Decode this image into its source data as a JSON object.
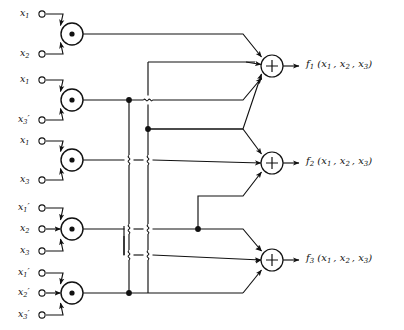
{
  "diagram": {
    "type": "logic-circuit",
    "background": "#ffffff",
    "line_color": "#1a1a1a",
    "gate_fill": "#ffffff"
  },
  "and_gates": [
    {
      "id": "and1",
      "symbol": "·",
      "cx": 72,
      "cy": 34,
      "r": 11,
      "inputs": [
        "x1",
        "x2"
      ],
      "product": "x1 x2"
    },
    {
      "id": "and2",
      "symbol": "·",
      "cx": 72,
      "cy": 100,
      "r": 11,
      "inputs": [
        "x1",
        "x3'"
      ],
      "product": "x1 x3'"
    },
    {
      "id": "and3",
      "symbol": "·",
      "cx": 72,
      "cy": 160,
      "r": 11,
      "inputs": [
        "x1",
        "x3"
      ],
      "product": "x1 x3"
    },
    {
      "id": "and4",
      "symbol": "·",
      "cx": 72,
      "cy": 229,
      "r": 11,
      "inputs": [
        "x1'",
        "x2",
        "x3"
      ],
      "product": "x1' x2 x3"
    },
    {
      "id": "and5",
      "symbol": "·",
      "cx": 72,
      "cy": 293,
      "r": 11,
      "inputs": [
        "x1'",
        "x2'",
        "x3'"
      ],
      "product": "x1' x2' x3'"
    }
  ],
  "adders": [
    {
      "id": "sum1",
      "symbol": "+",
      "cx": 272,
      "cy": 66,
      "r": 11,
      "output": "f1"
    },
    {
      "id": "sum2",
      "symbol": "+",
      "cx": 272,
      "cy": 163,
      "r": 11,
      "output": "f2"
    },
    {
      "id": "sum3",
      "symbol": "+",
      "cx": 272,
      "cy": 260,
      "r": 11,
      "output": "f3"
    }
  ],
  "input_terminals": [
    {
      "id": "t1",
      "base": "x",
      "sub": "1",
      "prime": false,
      "x": 38,
      "y": 14,
      "label": "x1"
    },
    {
      "id": "t2",
      "base": "x",
      "sub": "2",
      "prime": false,
      "x": 38,
      "y": 54,
      "label": "x2"
    },
    {
      "id": "t3",
      "base": "x",
      "sub": "1",
      "prime": false,
      "x": 38,
      "y": 80,
      "label": "x1"
    },
    {
      "id": "t4",
      "base": "x",
      "sub": "3",
      "prime": true,
      "x": 38,
      "y": 120,
      "label": "x3'"
    },
    {
      "id": "t5",
      "base": "x",
      "sub": "1",
      "prime": false,
      "x": 38,
      "y": 141,
      "label": "x1"
    },
    {
      "id": "t6",
      "base": "x",
      "sub": "3",
      "prime": false,
      "x": 38,
      "y": 180,
      "label": "x3"
    },
    {
      "id": "t7",
      "base": "x",
      "sub": "1",
      "prime": true,
      "x": 38,
      "y": 208,
      "label": "x1'"
    },
    {
      "id": "t8",
      "base": "x",
      "sub": "2",
      "prime": false,
      "x": 38,
      "y": 229,
      "label": "x2"
    },
    {
      "id": "t9",
      "base": "x",
      "sub": "3",
      "prime": false,
      "x": 38,
      "y": 251,
      "label": "x3"
    },
    {
      "id": "t10",
      "base": "x",
      "sub": "1",
      "prime": true,
      "x": 38,
      "y": 273,
      "label": "x1'"
    },
    {
      "id": "t11",
      "base": "x",
      "sub": "2",
      "prime": true,
      "x": 38,
      "y": 293,
      "label": "x2'"
    },
    {
      "id": "t12",
      "base": "x",
      "sub": "3",
      "prime": true,
      "x": 38,
      "y": 315,
      "label": "x3'"
    }
  ],
  "outputs": [
    {
      "id": "f1",
      "fn": "f",
      "sub": "1",
      "args": "(x1 , x2 , x3)",
      "x": 300,
      "y": 66,
      "text": "f1 (x1 , x2 , x3)"
    },
    {
      "id": "f2",
      "fn": "f",
      "sub": "2",
      "args": "(x1 , x2 , x3)",
      "x": 300,
      "y": 163,
      "text": "f2 (x1 , x2 , x3)"
    },
    {
      "id": "f3",
      "fn": "f",
      "sub": "3",
      "args": "(x1 , x2 , x3)",
      "x": 300,
      "y": 260,
      "text": "f3 (x1 , x2 , x3)"
    }
  ],
  "bus_lines": [
    {
      "id": "bus-a",
      "x": 129,
      "from_y": 100,
      "to_y": 293
    },
    {
      "id": "bus-b",
      "x": 148,
      "from_y": 62,
      "to_y": 236
    }
  ],
  "junction_dots": [
    {
      "id": "dot-and2-out",
      "x": 129,
      "y": 100
    },
    {
      "id": "dot-busb-mid",
      "x": 148,
      "y": 129
    },
    {
      "id": "dot-and4-tap",
      "x": 198,
      "y": 229
    },
    {
      "id": "dot-and5-out",
      "x": 129,
      "y": 293
    }
  ],
  "hops": [
    {
      "id": "hop-1",
      "x": 148,
      "y": 100
    },
    {
      "id": "hop-2",
      "x": 129,
      "y": 160
    },
    {
      "id": "hop-3",
      "x": 148,
      "y": 160
    },
    {
      "id": "hop-4",
      "x": 129,
      "y": 229
    },
    {
      "id": "hop-5",
      "x": 148,
      "y": 229
    },
    {
      "id": "hop-6",
      "x": 148,
      "y": 255
    },
    {
      "id": "hop-7",
      "x": 129,
      "y": 255
    }
  ]
}
